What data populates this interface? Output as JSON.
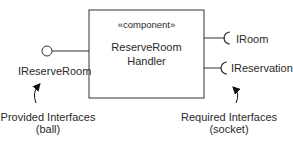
{
  "diagram": {
    "type": "UML component diagram",
    "component": {
      "stereotype": "«component»",
      "name_line1": "ReserveRoom",
      "name_line2": "Handler"
    },
    "provided_interfaces": [
      {
        "name": "IReserveRoom",
        "notation": "ball"
      }
    ],
    "required_interfaces": [
      {
        "name": "IRoom",
        "notation": "socket"
      },
      {
        "name": "IReservation",
        "notation": "socket"
      }
    ],
    "annotations": {
      "provided": {
        "line1": "Provided Interfaces",
        "line2": "(ball)"
      },
      "required": {
        "line1": "Required Interfaces",
        "line2": "(socket)"
      }
    },
    "colors": {
      "stroke": "#333333",
      "background": "#ffffff",
      "text": "#2a2a2a"
    }
  }
}
